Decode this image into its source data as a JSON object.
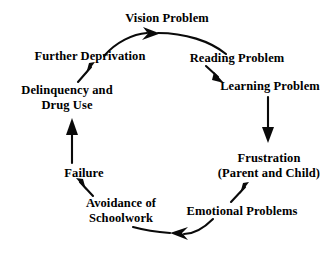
{
  "diagram": {
    "type": "cycle-flow",
    "direction": "clockwise",
    "background_color": "#ffffff",
    "text_color": "#000000",
    "arrow_color": "#0a0a0a",
    "nodes": [
      {
        "id": "vision",
        "label": "Vision Problem"
      },
      {
        "id": "reading",
        "label": "Reading Problem"
      },
      {
        "id": "learning",
        "label": "Learning Problem"
      },
      {
        "id": "frustration",
        "label_line1": "Frustration",
        "label_line2": "(Parent and Child)"
      },
      {
        "id": "emotional",
        "label": "Emotional Problems"
      },
      {
        "id": "avoidance",
        "label_line1": "Avoidance of",
        "label_line2": "Schoolwork"
      },
      {
        "id": "failure",
        "label": "Failure"
      },
      {
        "id": "delinquency",
        "label_line1": "Delinquency and",
        "label_line2": "Drug Use"
      },
      {
        "id": "deprivation",
        "label": "Further Deprivation"
      }
    ],
    "edges": [
      {
        "from": "deprivation",
        "to": "vision",
        "style": "arc-curved",
        "arrow": "right"
      },
      {
        "from": "vision",
        "to": "reading",
        "style": "arc-curved",
        "arrow": "none"
      },
      {
        "from": "reading",
        "to": "learning",
        "style": "diagonal",
        "arrow": "down-right"
      },
      {
        "from": "learning",
        "to": "frustration",
        "style": "vertical",
        "arrow": "down"
      },
      {
        "from": "emotional",
        "to": "frustration",
        "style": "diagonal",
        "arrow": "up-right"
      },
      {
        "from": "emotional",
        "to": "avoidance",
        "style": "arc-curved",
        "arrow": "left"
      },
      {
        "from": "avoidance",
        "to": "failure",
        "style": "diagonal",
        "arrow": "up-left"
      },
      {
        "from": "failure",
        "to": "delinquency",
        "style": "vertical",
        "arrow": "up"
      },
      {
        "from": "delinquency",
        "to": "deprivation",
        "style": "diagonal",
        "arrow": "up-right"
      }
    ]
  }
}
